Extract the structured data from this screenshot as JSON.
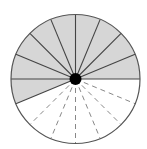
{
  "diagram": {
    "type": "fraction-circle",
    "total_sectors": 16,
    "shaded_sectors": 9,
    "unshaded_sectors": 7,
    "sector_angle_deg": 22.5,
    "shaded_range_deg": [
      0,
      202.5
    ],
    "unshaded_range_deg": [
      202.5,
      360
    ],
    "solid_radii_deg": [
      0,
      22.5,
      45,
      67.5,
      90,
      112.5,
      135,
      157.5,
      180,
      202.5
    ],
    "dashed_radii_deg": [
      225,
      247.5,
      270,
      292.5,
      315,
      337.5
    ],
    "center": [
      75.5,
      79
    ],
    "radius": 64.5,
    "center_dot_radius": 6,
    "colors": {
      "shaded_fill": "#d6d6d6",
      "unshaded_fill": "#ffffff",
      "outline": "#555555",
      "solid_line": "#444444",
      "dashed_line": "#888888",
      "center_dot": "#000000"
    }
  }
}
